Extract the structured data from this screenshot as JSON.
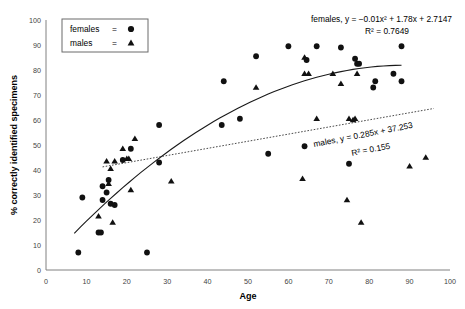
{
  "chart_data": {
    "type": "scatter",
    "title": "",
    "xlabel": "Age",
    "ylabel": "% correctly identified specimens",
    "xlim": [
      0,
      100
    ],
    "ylim": [
      0,
      100
    ],
    "xticks": [
      "0",
      "10",
      "20",
      "30",
      "40",
      "50",
      "60",
      "70",
      "80",
      "90",
      "100"
    ],
    "yticks": [
      "0",
      "10",
      "20",
      "30",
      "40",
      "50",
      "60",
      "70",
      "80",
      "90",
      "100"
    ],
    "grid": false,
    "legend_position": "top-left",
    "series": [
      {
        "name": "females",
        "marker": "circle",
        "points": [
          [
            8,
            7
          ],
          [
            9,
            29
          ],
          [
            13,
            15
          ],
          [
            13.6,
            15
          ],
          [
            14,
            28
          ],
          [
            14,
            33.5
          ],
          [
            15,
            31
          ],
          [
            15.5,
            36
          ],
          [
            16,
            26.5
          ],
          [
            17,
            26
          ],
          [
            19,
            44
          ],
          [
            21,
            48.5
          ],
          [
            25,
            7
          ],
          [
            28,
            43
          ],
          [
            28,
            58
          ],
          [
            43.5,
            58
          ],
          [
            44,
            75.5
          ],
          [
            48,
            60.5
          ],
          [
            52,
            85.5
          ],
          [
            55,
            46.5
          ],
          [
            60,
            89.5
          ],
          [
            64,
            49.5
          ],
          [
            64.5,
            84
          ],
          [
            67,
            89.5
          ],
          [
            73,
            89
          ],
          [
            75,
            42.5
          ],
          [
            76.5,
            84.5
          ],
          [
            77,
            82.5
          ],
          [
            77.5,
            82.5
          ],
          [
            81,
            73
          ],
          [
            81.5,
            75.5
          ],
          [
            86,
            78.5
          ],
          [
            88,
            75.5
          ],
          [
            88,
            89.5
          ]
        ]
      },
      {
        "name": "males",
        "marker": "triangle",
        "points": [
          [
            13,
            21.5
          ],
          [
            15,
            43.5
          ],
          [
            15.5,
            34.5
          ],
          [
            16,
            40.5
          ],
          [
            16.5,
            19
          ],
          [
            17,
            43.5
          ],
          [
            19,
            48.5
          ],
          [
            20,
            44.5
          ],
          [
            20.5,
            44.5
          ],
          [
            21,
            32
          ],
          [
            22,
            52.5
          ],
          [
            31,
            35.5
          ],
          [
            52,
            73
          ],
          [
            63.5,
            36.5
          ],
          [
            64,
            78.5
          ],
          [
            64,
            85
          ],
          [
            65,
            78.5
          ],
          [
            67,
            60.5
          ],
          [
            71,
            78.5
          ],
          [
            73,
            74.5
          ],
          [
            74.5,
            28
          ],
          [
            75,
            60.5
          ],
          [
            76,
            60
          ],
          [
            76.5,
            60.5
          ],
          [
            77,
            78.5
          ],
          [
            78,
            19
          ],
          [
            90,
            41.5
          ],
          [
            94,
            45
          ]
        ]
      }
    ],
    "trendlines": [
      {
        "series": "females",
        "style": "solid",
        "equation": "females, y = −0.01x² + 1.78x + 2.7147",
        "r_squared": "R² = 0.7649"
      },
      {
        "series": "males",
        "style": "dotted",
        "equation": "males, y = 0.285x + 37.253",
        "r_squared": "R² = 0.155"
      }
    ]
  },
  "legend": {
    "entries": [
      {
        "label": "females",
        "equals": "=",
        "marker": "circle-marker"
      },
      {
        "label": "males",
        "equals": "=",
        "marker": "triangle-marker"
      }
    ]
  },
  "annotations": {
    "females_equation": "females, y = −0.01x² + 1.78x + 2.7147",
    "females_r2": "R² = 0.7649",
    "males_equation": "males, y = 0.285x + 37.253",
    "males_r2": "R² = 0.155"
  },
  "axes": {
    "x_title": "Age",
    "y_title": "% correctly identified specimens"
  },
  "colors": {
    "marker": "#111111",
    "axis": "#808080",
    "trend_solid": "#1a1a1a",
    "trend_dotted": "#4a4a4a",
    "text": "#000000",
    "tick_text": "#3f3f3f"
  }
}
